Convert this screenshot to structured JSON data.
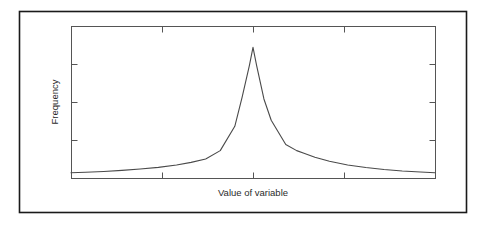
{
  "figure": {
    "background_color": "#ffffff",
    "outer_border": {
      "name": "outer-frame",
      "color": "#1a1a1a",
      "x": 19,
      "y": 11,
      "width": 447,
      "height": 201,
      "line_width": 1.6
    },
    "plot_frame": {
      "name": "plot-frame",
      "color": "#555555",
      "x": 71,
      "y": 26,
      "width": 364,
      "height": 152,
      "line_width": 1
    },
    "curve": {
      "name": "frequency-curve",
      "color": "#4a4a4a",
      "line_width": 1.1
    },
    "tick": {
      "color": "#555555",
      "length": 6,
      "line_width": 1
    }
  },
  "chart_data": {
    "type": "line",
    "title": "",
    "subtitle": "",
    "xlabel": "Value of variable",
    "ylabel": "Frequency",
    "grid": false,
    "legend": null,
    "legend_position": "none",
    "xlim": [
      0,
      100
    ],
    "ylim": [
      0,
      100
    ],
    "x_tick_values": [
      25,
      50,
      75
    ],
    "y_tick_values": [
      25,
      50,
      75
    ],
    "x_tick_labels": [
      "",
      "",
      ""
    ],
    "y_tick_labels": [
      "",
      "",
      ""
    ],
    "ticks_on_top_axis": true,
    "ticks_on_right_axis": true,
    "x": [
      0,
      4,
      9,
      14,
      19,
      24,
      29,
      33,
      37,
      41,
      45,
      47,
      49,
      50,
      51,
      53,
      55,
      59,
      62,
      64,
      67,
      71,
      76,
      81,
      86,
      91,
      96,
      100
    ],
    "y": [
      3.5,
      3.8,
      4.3,
      5.0,
      5.9,
      7.0,
      8.6,
      10.3,
      12.5,
      18.0,
      34.0,
      53.0,
      74.0,
      86.0,
      74.0,
      52.0,
      38.0,
      22.0,
      18.0,
      16.3,
      13.6,
      11.0,
      8.6,
      6.9,
      5.6,
      4.6,
      3.9,
      3.5
    ]
  },
  "labels": {
    "x_axis_title": "Value of variable",
    "y_axis_title": "Frequency"
  }
}
